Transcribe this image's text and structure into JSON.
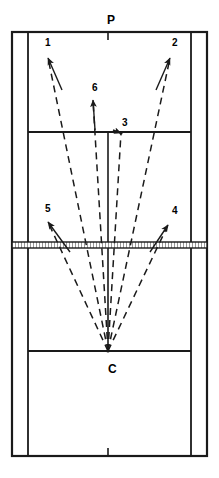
{
  "diagram": {
    "type": "badminton-court-trajectory-diagram",
    "title": "",
    "point_labels": [
      {
        "id": "P",
        "text": "P",
        "x": 107,
        "y": 14,
        "role": "player-position-top"
      },
      {
        "id": "C",
        "text": "C",
        "x": 108,
        "y": 363,
        "role": "shuttle-origin-center"
      }
    ],
    "shot_labels": [
      {
        "id": "1",
        "text": "1",
        "x": 45,
        "y": 38
      },
      {
        "id": "2",
        "text": "2",
        "x": 172,
        "y": 38
      },
      {
        "id": "3",
        "text": "3",
        "x": 122,
        "y": 118
      },
      {
        "id": "4",
        "text": "4",
        "x": 172,
        "y": 206
      },
      {
        "id": "5",
        "text": "5",
        "x": 45,
        "y": 204
      },
      {
        "id": "6",
        "text": "6",
        "x": 92,
        "y": 83
      }
    ],
    "colors": {
      "line": "#1a1a1a",
      "dash": "#1a1a1a",
      "net": "#3a3a3a",
      "background": "#ffffff"
    },
    "court": {
      "outer": {
        "x1": 12,
        "y1": 32,
        "x2": 207,
        "y2": 456
      },
      "singles_sideline_left_x": 28,
      "singles_sideline_right_x": 191,
      "centre_line_x": 108,
      "net_y": 245,
      "short_service_line_far_y": 132,
      "short_service_line_near_y": 351,
      "long_service_line_doubles_far_y": 40,
      "long_service_line_doubles_near_y": 448,
      "centre_mark_top": {
        "x": 108,
        "y1": 32,
        "y2": 40
      },
      "centre_mark_bottom": {
        "x": 108,
        "y1": 448,
        "y2": 456
      }
    },
    "trajectories": [
      {
        "shot": "1",
        "from": [
          108,
          351
        ],
        "to": [
          48,
          58
        ],
        "style": "dashed"
      },
      {
        "shot": "6",
        "from": [
          108,
          351
        ],
        "to": [
          93,
          100
        ],
        "style": "dashed"
      },
      {
        "shot": "3",
        "from": [
          108,
          351
        ],
        "to": [
          121,
          133
        ],
        "style": "dashed"
      },
      {
        "shot": "2",
        "from": [
          108,
          351
        ],
        "to": [
          170,
          58
        ],
        "style": "dashed"
      },
      {
        "shot": "5",
        "from": [
          108,
          351
        ],
        "to": [
          48,
          222
        ],
        "style": "dashed"
      },
      {
        "shot": "4",
        "from": [
          108,
          351
        ],
        "to": [
          168,
          225
        ],
        "style": "dashed"
      }
    ],
    "pointer_arrows": [
      {
        "shot": "1",
        "tail": [
          62,
          90
        ],
        "head": [
          48,
          58
        ]
      },
      {
        "shot": "2",
        "tail": [
          156,
          90
        ],
        "head": [
          170,
          58
        ]
      },
      {
        "shot": "3",
        "tail": [
          113,
          130
        ],
        "head": [
          121,
          133
        ]
      },
      {
        "shot": "4",
        "tail": [
          150,
          252
        ],
        "head": [
          168,
          225
        ]
      },
      {
        "shot": "5",
        "tail": [
          70,
          252
        ],
        "head": [
          48,
          222
        ]
      },
      {
        "shot": "6",
        "tail": [
          95,
          130
        ],
        "head": [
          93,
          100
        ]
      }
    ]
  }
}
